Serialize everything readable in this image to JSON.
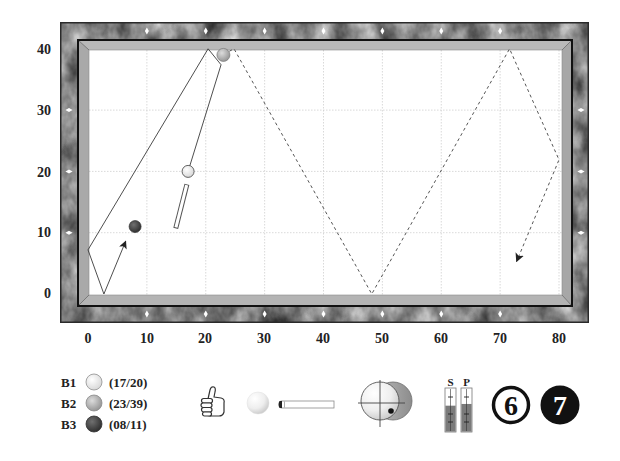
{
  "diagram": {
    "x_axis": {
      "ticks": [
        "0",
        "10",
        "20",
        "30",
        "40",
        "50",
        "60",
        "70",
        "80"
      ]
    },
    "y_axis": {
      "ticks": [
        "40",
        "30",
        "20",
        "10",
        "0"
      ]
    },
    "grid": {
      "x": [
        10,
        20,
        30,
        40,
        50,
        60,
        70,
        80
      ],
      "y": [
        10,
        20,
        30
      ]
    },
    "diamonds": {
      "top": [
        10,
        20,
        30,
        40,
        50,
        60,
        70
      ],
      "bottom": [
        10,
        20,
        30,
        40,
        50,
        60,
        70
      ],
      "left": [
        10,
        20,
        30
      ],
      "right": [
        10,
        20,
        30
      ]
    },
    "balls": [
      {
        "id": "B1",
        "x": 17,
        "y": 20,
        "color": "#ffffff"
      },
      {
        "id": "B2",
        "x": 23,
        "y": 39,
        "color": "#b0aca6"
      },
      {
        "id": "B3",
        "x": 8,
        "y": 11,
        "color": "#555555"
      }
    ],
    "paths": {
      "cue_ball": {
        "style": "solid",
        "points": [
          [
            17,
            20
          ],
          [
            22.6,
            37.4
          ],
          [
            20.4,
            40
          ],
          [
            0,
            7.2
          ],
          [
            2.7,
            0
          ],
          [
            6.4,
            8.6
          ]
        ],
        "arrow": true
      },
      "object_ball": {
        "style": "dashed",
        "points": [
          [
            24,
            39.6
          ],
          [
            24.8,
            40
          ],
          [
            48.2,
            0
          ],
          [
            71.6,
            40
          ],
          [
            80,
            21.9
          ],
          [
            72.8,
            5.3
          ]
        ],
        "arrow": true
      }
    },
    "cue_stick": {
      "tip": [
        16.8,
        17.9
      ],
      "butt": [
        14.9,
        10.7
      ]
    }
  },
  "panel": {
    "legend": [
      {
        "label": "B1",
        "coords": "(17/20)",
        "color": "#f2f2f2"
      },
      {
        "label": "B2",
        "coords": "(23/39)",
        "color": "#b8b8b8"
      },
      {
        "label": "B3",
        "coords": "(08/11)",
        "color": "#484848"
      }
    ],
    "rating_icon": "thumbs-up-icon",
    "stroke_icons": [
      "cue-ball-icon",
      "cue-stick-icon"
    ],
    "spin": {
      "hit_point_offset": [
        11,
        9
      ]
    },
    "gauges": [
      {
        "label": "S",
        "value": 60
      },
      {
        "label": "P",
        "value": 64
      }
    ],
    "counters": [
      {
        "value": "6",
        "style": "outline"
      },
      {
        "value": "7",
        "style": "filled"
      }
    ]
  }
}
